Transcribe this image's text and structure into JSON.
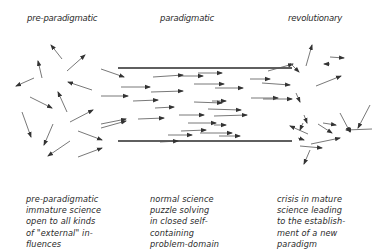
{
  "headings": {
    "left": "pre-paradigmatic",
    "center": "paradigmatic",
    "right": "revolutionary"
  },
  "descriptions": {
    "left": [
      "pre-paradigmatic",
      "immature science",
      "open to all kinds",
      "of \"external\" in-",
      "fluences"
    ],
    "center": [
      "normal science",
      "puzzle solving",
      "in closed self-",
      "containing",
      "problem-domain"
    ],
    "right": [
      "crisis in mature",
      "science leading",
      "to the establish-",
      "ment of a new",
      "paradigm"
    ]
  },
  "diagram": {
    "line_color": "#2a2a2a",
    "arrow_color": "#555555",
    "channel": {
      "x1": 118,
      "x2": 292,
      "top_y": 68,
      "bottom_y": 141
    },
    "arrows_left": [
      [
        62,
        59,
        51,
        45
      ],
      [
        67,
        71,
        85,
        55
      ],
      [
        42,
        78,
        38,
        61
      ],
      [
        34,
        78,
        16,
        86
      ],
      [
        92,
        90,
        68,
        82
      ],
      [
        30,
        97,
        52,
        108
      ],
      [
        67,
        112,
        58,
        92
      ],
      [
        70,
        122,
        93,
        110
      ],
      [
        22,
        112,
        31,
        137
      ],
      [
        53,
        124,
        44,
        145
      ],
      [
        78,
        131,
        102,
        140
      ],
      [
        101,
        128,
        126,
        121
      ],
      [
        70,
        141,
        48,
        156
      ],
      [
        78,
        157,
        102,
        148
      ]
    ],
    "arrows_center": [
      [
        101,
        69,
        124,
        77
      ],
      [
        121,
        87,
        150,
        87
      ],
      [
        101,
        96,
        128,
        96
      ],
      [
        133,
        101,
        158,
        100
      ],
      [
        101,
        124,
        126,
        119
      ],
      [
        138,
        119,
        164,
        118
      ],
      [
        151,
        92,
        183,
        91
      ],
      [
        155,
        108,
        174,
        107
      ],
      [
        179,
        76,
        203,
        76
      ],
      [
        179,
        115,
        204,
        115
      ],
      [
        181,
        131,
        206,
        130
      ],
      [
        168,
        135,
        192,
        135
      ],
      [
        153,
        77,
        183,
        75
      ],
      [
        160,
        142,
        178,
        141
      ],
      [
        194,
        84,
        224,
        84
      ],
      [
        198,
        73,
        222,
        73
      ],
      [
        215,
        88,
        243,
        88
      ],
      [
        212,
        101,
        226,
        101
      ],
      [
        188,
        123,
        216,
        123
      ],
      [
        208,
        109,
        241,
        110
      ],
      [
        214,
        116,
        247,
        115
      ],
      [
        194,
        102,
        222,
        103
      ],
      [
        219,
        136,
        240,
        136
      ],
      [
        250,
        79,
        270,
        79
      ],
      [
        251,
        98,
        278,
        98
      ],
      [
        214,
        125,
        226,
        125
      ],
      [
        200,
        133,
        232,
        133
      ]
    ],
    "arrows_right": [
      [
        268,
        71,
        293,
        64
      ],
      [
        290,
        63,
        299,
        72
      ],
      [
        262,
        83,
        290,
        85
      ],
      [
        263,
        99,
        292,
        99
      ],
      [
        296,
        93,
        300,
        102
      ],
      [
        306,
        66,
        312,
        45
      ],
      [
        330,
        64,
        324,
        64
      ],
      [
        316,
        86,
        341,
        76
      ],
      [
        330,
        57,
        344,
        58
      ],
      [
        304,
        115,
        307,
        123
      ],
      [
        340,
        113,
        350,
        132
      ],
      [
        370,
        105,
        358,
        128
      ],
      [
        303,
        123,
        300,
        130
      ],
      [
        323,
        123,
        336,
        125
      ],
      [
        298,
        138,
        304,
        140
      ],
      [
        318,
        124,
        332,
        133
      ],
      [
        308,
        134,
        290,
        126
      ],
      [
        311,
        144,
        340,
        138
      ],
      [
        372,
        129,
        346,
        130
      ],
      [
        300,
        146,
        322,
        148
      ],
      [
        310,
        150,
        304,
        164
      ]
    ]
  }
}
